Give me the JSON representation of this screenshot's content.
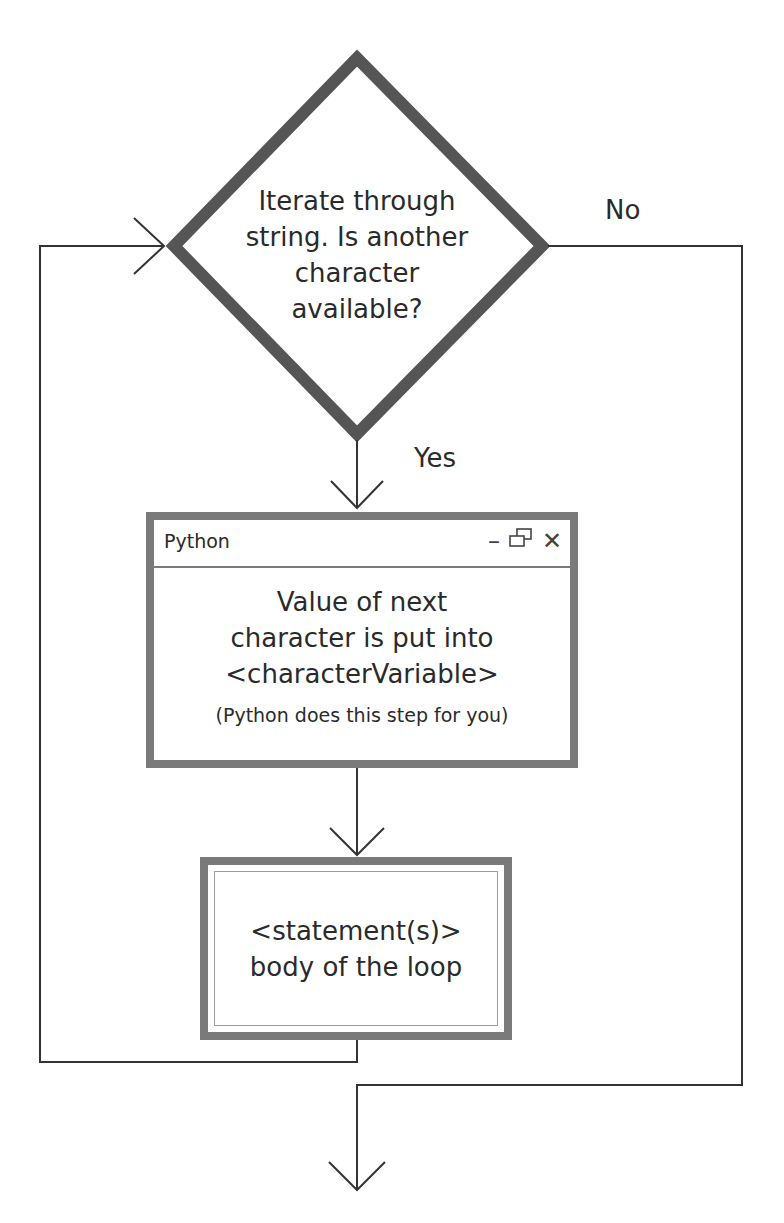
{
  "diagram": {
    "type": "flowchart",
    "decision": {
      "lines": [
        "Iterate through",
        "string. Is another",
        "character",
        "available?"
      ]
    },
    "branches": {
      "no_label": "No",
      "yes_label": "Yes"
    },
    "python_step": {
      "window_title": "Python",
      "controls": {
        "minimize": "–",
        "restore": "❐",
        "close": "✕"
      },
      "lines": [
        "Value of next",
        "character is put into",
        "<characterVariable>"
      ],
      "note": "(Python does this step for you)"
    },
    "statement_step": {
      "lines": [
        "<statement(s)>",
        "body of the loop"
      ]
    },
    "colors": {
      "shape_border": "#7a7a7a",
      "decision_border": "#555555",
      "connector": "#333333",
      "text": "#2a2a2a",
      "background": "#ffffff"
    }
  }
}
